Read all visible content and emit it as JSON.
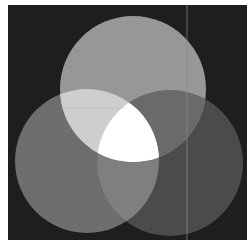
{
  "image": {
    "description": "Three overlapping circles on a dark background (additive light mixing, grayscale)",
    "canvas": {
      "width": 252,
      "height": 242,
      "page_color": "#ffffff"
    },
    "backdrop": {
      "x": 8,
      "y": 5,
      "width": 239,
      "height": 235,
      "color": "#1e1e1e"
    },
    "circles": [
      {
        "name": "top",
        "cx": 133,
        "cy": 89,
        "r": 73,
        "color": "#979797"
      },
      {
        "name": "left",
        "cx": 87,
        "cy": 161,
        "r": 72,
        "color": "#6e6e6e"
      },
      {
        "name": "right",
        "cx": 170,
        "cy": 163,
        "r": 73,
        "color": "#4b4b4b"
      }
    ],
    "overlaps": {
      "top_left": "#cecece",
      "top_right": "#6a6a6a",
      "left_right": "#7f7f7f",
      "all_three": "#ffffff"
    },
    "artifacts": {
      "vertical_line": {
        "x": 187,
        "y1": 5,
        "y2": 240,
        "color": "#8a8a8a"
      },
      "horizontal_line": {
        "y": 108,
        "x1": 62,
        "x2": 125,
        "color": "#b4b4b4"
      }
    }
  }
}
